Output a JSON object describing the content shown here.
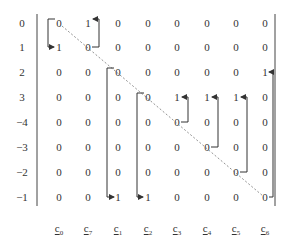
{
  "row_labels": [
    "0",
    "1",
    "2",
    "3",
    "−4",
    "−3",
    "−2",
    "−1"
  ],
  "col_labels": [
    {
      "base": "c",
      "sub": "0"
    },
    {
      "base": "c",
      "sub": "7"
    },
    {
      "base": "c",
      "sub": "1"
    },
    {
      "base": "c",
      "sub": "2"
    },
    {
      "base": "c",
      "sub": "3"
    },
    {
      "base": "c",
      "sub": "4"
    },
    {
      "base": "c",
      "sub": "5"
    },
    {
      "base": "c",
      "sub": "6"
    }
  ],
  "matrix": [
    [
      "0",
      "1",
      "0",
      "0",
      "0",
      "0",
      "0",
      "0"
    ],
    [
      "1",
      "0",
      "0",
      "0",
      "0",
      "0",
      "0",
      "0"
    ],
    [
      "0",
      "0",
      "0",
      "0",
      "0",
      "0",
      "0",
      "1"
    ],
    [
      "0",
      "0",
      "0",
      "0",
      "1",
      "1",
      "1",
      "0"
    ],
    [
      "0",
      "0",
      "0",
      "0",
      "0",
      "0",
      "0",
      "0"
    ],
    [
      "0",
      "0",
      "0",
      "0",
      "0",
      "0",
      "0",
      "0"
    ],
    [
      "0",
      "0",
      "0",
      "0",
      "0",
      "0",
      "0",
      "0"
    ],
    [
      "0",
      "0",
      "1",
      "1",
      "0",
      "0",
      "0",
      "0"
    ]
  ],
  "colors": {
    "text": "#333333",
    "lines": "#333333",
    "diagonal": "#666666"
  }
}
